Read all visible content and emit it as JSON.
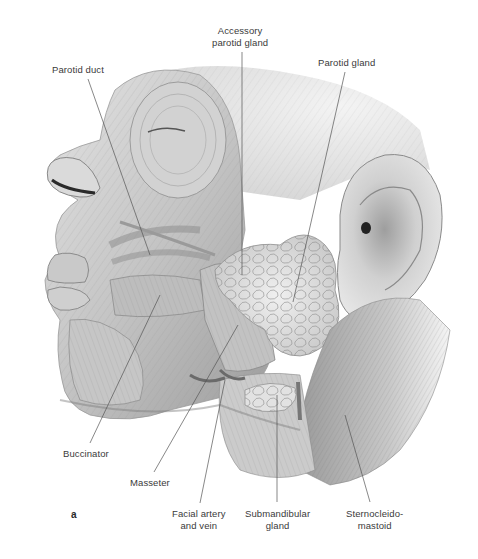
{
  "figure": {
    "panel_letter": "a",
    "colors": {
      "background": "#ffffff",
      "label_text": "#3a3a3a",
      "leader_line": "#555555",
      "muscle_light": "#d9d9d9",
      "muscle_mid": "#b5b5b5",
      "muscle_dark": "#8a8a8a"
    },
    "labels": [
      {
        "id": "parotid-duct",
        "lines": [
          "Parotid duct"
        ]
      },
      {
        "id": "accessory-parotid-gland",
        "lines": [
          "Accessory",
          "parotid gland"
        ]
      },
      {
        "id": "parotid-gland",
        "lines": [
          "Parotid gland"
        ]
      },
      {
        "id": "buccinator",
        "lines": [
          "Buccinator"
        ]
      },
      {
        "id": "masseter",
        "lines": [
          "Masseter"
        ]
      },
      {
        "id": "facial-artery-and-vein",
        "lines": [
          "Facial artery",
          "and vein"
        ]
      },
      {
        "id": "submandibular-gland",
        "lines": [
          "Submandibular",
          "gland"
        ]
      },
      {
        "id": "sternocleidomastoid",
        "lines": [
          "Sternocleido-",
          "mastoid"
        ]
      }
    ]
  }
}
